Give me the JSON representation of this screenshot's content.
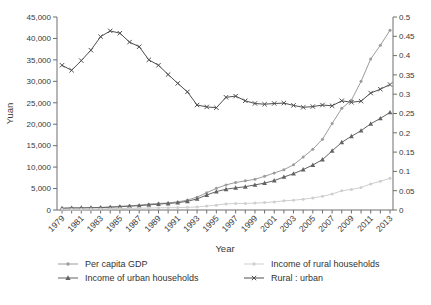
{
  "chart_data": {
    "type": "line",
    "title": "",
    "xlabel": "Year",
    "ylabel_left": "Yuan",
    "ylabel_right": "",
    "grid": false,
    "legend_position": "bottom",
    "x": [
      1979,
      1980,
      1981,
      1982,
      1983,
      1984,
      1985,
      1986,
      1987,
      1988,
      1989,
      1990,
      1991,
      1992,
      1993,
      1994,
      1995,
      1996,
      1997,
      1998,
      1999,
      2000,
      2001,
      2002,
      2003,
      2004,
      2005,
      2006,
      2007,
      2008,
      2009,
      2010,
      2011,
      2012,
      2013
    ],
    "x_tick_labels": [
      "1979",
      "1981",
      "1983",
      "1985",
      "1987",
      "1989",
      "1991",
      "1993",
      "1995",
      "1997",
      "1999",
      "2001",
      "2003",
      "2005",
      "2007",
      "2009",
      "2011",
      "2013"
    ],
    "left_axis": {
      "min": 0,
      "max": 45000,
      "tick_step": 5000,
      "tick_labels": [
        "0",
        "5,000",
        "10,000",
        "15,000",
        "20,000",
        "25,000",
        "30,000",
        "35,000",
        "40,000",
        "45,000"
      ]
    },
    "right_axis": {
      "min": 0,
      "max": 0.5,
      "tick_step": 0.05,
      "tick_labels": [
        "0",
        "0.05",
        "0.1",
        "0.15",
        "0.2",
        "0.25",
        "0.3",
        "0.35",
        "0.4",
        "0.45",
        "0.5"
      ]
    },
    "series": [
      {
        "name": "Per capita GDP",
        "axis": "left",
        "marker": "dot",
        "color": "#9c9c9c",
        "values": [
          423,
          463,
          492,
          528,
          583,
          695,
          858,
          963,
          1112,
          1366,
          1519,
          1644,
          1893,
          2311,
          2998,
          4044,
          5046,
          5846,
          6420,
          6796,
          7159,
          7858,
          8622,
          9398,
          10542,
          12336,
          14185,
          16500,
          20169,
          23708,
          25608,
          30015,
          35198,
          38420,
          41908
        ]
      },
      {
        "name": "Income of urban households",
        "axis": "left",
        "marker": "triangle",
        "color": "#636363",
        "values": [
          405,
          478,
          500,
          535,
          565,
          651,
          739,
          900,
          1002,
          1181,
          1376,
          1510,
          1701,
          2027,
          2577,
          3496,
          4283,
          4839,
          5160,
          5425,
          5854,
          6280,
          6860,
          7703,
          8472,
          9422,
          10493,
          11760,
          13786,
          15781,
          17175,
          18500,
          20100,
          21350,
          22750
        ]
      },
      {
        "name": "Income of rural households",
        "axis": "left",
        "marker": "dot",
        "color": "#cfcfcf",
        "values": [
          152,
          173,
          194,
          221,
          254,
          302,
          338,
          391,
          424,
          459,
          516,
          530,
          558,
          620,
          701,
          933,
          1135,
          1413,
          1522,
          1535,
          1616,
          1721,
          1893,
          2134,
          2296,
          2506,
          2812,
          3199,
          3722,
          4466,
          4792,
          5217,
          6090,
          6683,
          7394
        ]
      },
      {
        "name": "Rural : urban",
        "axis": "right",
        "marker": "cross",
        "color": "#4f4f4f",
        "values": [
          0.375,
          0.362,
          0.387,
          0.414,
          0.449,
          0.464,
          0.458,
          0.435,
          0.423,
          0.389,
          0.375,
          0.351,
          0.328,
          0.306,
          0.272,
          0.267,
          0.265,
          0.292,
          0.295,
          0.283,
          0.276,
          0.274,
          0.276,
          0.277,
          0.271,
          0.266,
          0.268,
          0.272,
          0.27,
          0.283,
          0.279,
          0.282,
          0.303,
          0.313,
          0.325
        ]
      }
    ],
    "colors": {
      "axis": "#6e6e6e",
      "text": "#383838"
    }
  }
}
